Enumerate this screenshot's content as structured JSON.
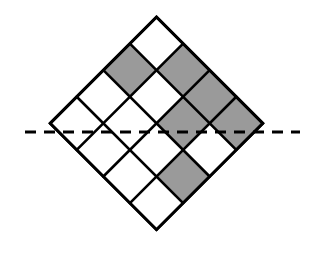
{
  "figure": {
    "background_color": "#ffffff"
  },
  "geometry": {
    "grid_rows": 4,
    "grid_cols": 4,
    "rotation_degrees": 45,
    "center_x": 156.5,
    "center_y": 132,
    "cell_size": 37.6,
    "apex_top": {
      "x": 156.5,
      "y": 17
    },
    "apex_bottom": {
      "x": 156.5,
      "y": 247
    },
    "vertex_left": {
      "x": 50,
      "y": 132
    },
    "vertex_right": {
      "x": 263,
      "y": 132
    }
  },
  "style": {
    "shaded_fill": "#9a9a9a",
    "unshaded_fill": "#ffffff",
    "stroke_color": "#000000",
    "stroke_width": 2.6,
    "outline_width": 3.0,
    "dash_color": "#000000",
    "dash_width": 3.0,
    "dash_pattern": "11 8"
  },
  "axis": {
    "name": "horizontal-symmetry-axis",
    "x1": 25,
    "x2": 300,
    "y": 132,
    "label": ""
  },
  "cells": [
    {
      "row": 0,
      "col": 0,
      "shaded": false
    },
    {
      "row": 0,
      "col": 1,
      "shaded": true
    },
    {
      "row": 0,
      "col": 2,
      "shaded": true
    },
    {
      "row": 0,
      "col": 3,
      "shaded": true
    },
    {
      "row": 1,
      "col": 0,
      "shaded": true
    },
    {
      "row": 1,
      "col": 1,
      "shaded": false
    },
    {
      "row": 1,
      "col": 2,
      "shaded": true
    },
    {
      "row": 1,
      "col": 3,
      "shaded": false
    },
    {
      "row": 2,
      "col": 0,
      "shaded": false
    },
    {
      "row": 2,
      "col": 1,
      "shaded": false
    },
    {
      "row": 2,
      "col": 2,
      "shaded": false
    },
    {
      "row": 2,
      "col": 3,
      "shaded": true
    },
    {
      "row": 3,
      "col": 0,
      "shaded": false
    },
    {
      "row": 3,
      "col": 1,
      "shaded": false
    },
    {
      "row": 3,
      "col": 2,
      "shaded": false
    },
    {
      "row": 3,
      "col": 3,
      "shaded": false
    }
  ],
  "counts": {
    "total_cells": 16,
    "shaded_cells": 6,
    "unshaded_cells": 10
  }
}
